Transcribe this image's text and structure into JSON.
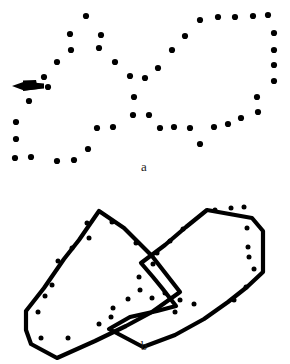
{
  "figure": {
    "background_color": "#ffffff",
    "ink_color": "#000000",
    "width": 290,
    "height": 364
  },
  "panels": [
    {
      "id": "a",
      "label": "a",
      "label_x": 144,
      "label_y": 167,
      "description": "Dot pattern forming implied crossing contours, with a solid arrow marker at the left",
      "dot_radius": 3.1,
      "dot_color": "#000000",
      "dots": [
        [
          86,
          16
        ],
        [
          70,
          34
        ],
        [
          101,
          35
        ],
        [
          71,
          50
        ],
        [
          99,
          48
        ],
        [
          57,
          62
        ],
        [
          115,
          62
        ],
        [
          44,
          77
        ],
        [
          48,
          87
        ],
        [
          29,
          101
        ],
        [
          16,
          122
        ],
        [
          16,
          139
        ],
        [
          15,
          158
        ],
        [
          31,
          157
        ],
        [
          57,
          161
        ],
        [
          74,
          160
        ],
        [
          88,
          149
        ],
        [
          97,
          128
        ],
        [
          113,
          127
        ],
        [
          130,
          76
        ],
        [
          145,
          78
        ],
        [
          134,
          97
        ],
        [
          133,
          115
        ],
        [
          149,
          115
        ],
        [
          160,
          128
        ],
        [
          174,
          127
        ],
        [
          190,
          128
        ],
        [
          200,
          144
        ],
        [
          214,
          127
        ],
        [
          228,
          124
        ],
        [
          241,
          118
        ],
        [
          158,
          68
        ],
        [
          172,
          50
        ],
        [
          185,
          36
        ],
        [
          200,
          20
        ],
        [
          218,
          17
        ],
        [
          235,
          17
        ],
        [
          253,
          16
        ],
        [
          268,
          15
        ],
        [
          274,
          33
        ],
        [
          274,
          50
        ],
        [
          274,
          65
        ],
        [
          274,
          81
        ],
        [
          257,
          97
        ],
        [
          258,
          112
        ]
      ],
      "arrow": {
        "name": "pointer-arrow",
        "direction": "left",
        "tip_x": 12,
        "tip_y": 86,
        "tail_x": 44,
        "tail_y": 85,
        "color": "#000000"
      }
    },
    {
      "id": "b",
      "label": "b",
      "label_x": 144,
      "label_y": 346,
      "description": "Same dot pattern with the two crossing polygon contours explicitly drawn as thick black outlines",
      "dot_radius": 2.5,
      "dot_color": "#000000",
      "stroke_color": "#000000",
      "stroke_width": 4.2,
      "polygon_left": [
        [
          99,
          211
        ],
        [
          79,
          240
        ],
        [
          64,
          259
        ],
        [
          44,
          288
        ],
        [
          26,
          311
        ],
        [
          26,
          330
        ],
        [
          31,
          344
        ],
        [
          57,
          358
        ],
        [
          95,
          341
        ],
        [
          126,
          326
        ],
        [
          152,
          312
        ],
        [
          180,
          292
        ],
        [
          152,
          256
        ],
        [
          124,
          228
        ]
      ],
      "polygon_right": [
        [
          207,
          210
        ],
        [
          186,
          227
        ],
        [
          165,
          245
        ],
        [
          141,
          263
        ],
        [
          153,
          277
        ],
        [
          162,
          288
        ],
        [
          176,
          306
        ],
        [
          157,
          311
        ],
        [
          130,
          317
        ],
        [
          109,
          329
        ],
        [
          143,
          347
        ],
        [
          175,
          335
        ],
        [
          204,
          319
        ],
        [
          228,
          302
        ],
        [
          247,
          287
        ],
        [
          263,
          272
        ],
        [
          263,
          250
        ],
        [
          263,
          231
        ],
        [
          252,
          218
        ]
      ],
      "dots": [
        [
          87,
          223
        ],
        [
          89,
          238
        ],
        [
          72,
          248
        ],
        [
          58,
          261
        ],
        [
          52,
          285
        ],
        [
          45,
          296
        ],
        [
          38,
          312
        ],
        [
          41,
          338
        ],
        [
          68,
          338
        ],
        [
          99,
          324
        ],
        [
          111,
          317
        ],
        [
          113,
          308
        ],
        [
          128,
          299
        ],
        [
          112,
          222
        ],
        [
          136,
          243
        ],
        [
          139,
          277
        ],
        [
          153,
          264
        ],
        [
          140,
          290
        ],
        [
          152,
          298
        ],
        [
          183,
          229
        ],
        [
          170,
          241
        ],
        [
          157,
          253
        ],
        [
          180,
          300
        ],
        [
          165,
          293
        ],
        [
          194,
          304
        ],
        [
          175,
          312
        ],
        [
          215,
          210
        ],
        [
          231,
          208
        ],
        [
          244,
          207
        ],
        [
          247,
          228
        ],
        [
          248,
          247
        ],
        [
          249,
          257
        ],
        [
          254,
          269
        ],
        [
          246,
          287
        ],
        [
          234,
          300
        ]
      ]
    }
  ]
}
